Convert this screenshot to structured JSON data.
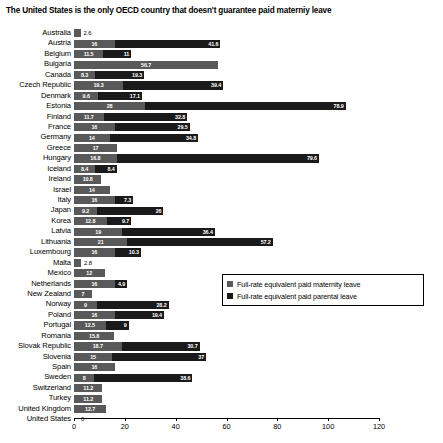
{
  "chart_data": {
    "type": "bar",
    "orientation": "horizontal",
    "stacked": true,
    "title": "The United States is the only OECD country that doesn't guarantee paid materniy leave",
    "xlabel": "",
    "ylabel": "",
    "xlim": [
      0,
      120
    ],
    "xticks": [
      0,
      20,
      40,
      60,
      80,
      100,
      120
    ],
    "xtick_labels": [
      "0",
      "20",
      "40",
      "60",
      "80",
      "100",
      "120"
    ],
    "grid": false,
    "legend_position": "middle-right",
    "series": [
      {
        "name": "Full-rate equivalent paid maternity leave",
        "color": "#595959",
        "values": [
          2.6,
          16,
          11.5,
          56.7,
          8.3,
          19.3,
          9.6,
          28,
          11.7,
          16,
          14,
          17,
          16.8,
          8.4,
          10.8,
          14,
          16,
          9.2,
          12.8,
          19,
          21,
          16,
          2.8,
          12,
          16,
          7,
          9,
          16,
          12.5,
          15.8,
          18.7,
          15,
          16,
          8,
          11.2,
          11.2,
          12.7,
          0
        ]
      },
      {
        "name": "Full-rate equivalent paid parental leave",
        "color": "#1a1a1a",
        "values": [
          0,
          41.6,
          11,
          0,
          19.3,
          39.4,
          17.1,
          78.9,
          32.8,
          29.5,
          34.8,
          0,
          79.6,
          8.4,
          0,
          0,
          7.3,
          26,
          9.7,
          36.4,
          57.2,
          10.3,
          0,
          0,
          4.9,
          0,
          28.2,
          19.4,
          9,
          0,
          30.7,
          37,
          0,
          38.6,
          0,
          0,
          0,
          0
        ]
      }
    ],
    "categories": [
      "Australia",
      "Austria",
      "Belgium",
      "Bulgaria",
      "Canada",
      "Czech Republic",
      "Denmark",
      "Estonia",
      "Finland",
      "France",
      "Germany",
      "Greece",
      "Hungary",
      "Iceland",
      "Ireland",
      "Israel",
      "Italy",
      "Japan",
      "Korea",
      "Latvia",
      "Lithuania",
      "Luxembourg",
      "Malta",
      "Mexico",
      "Netherlands",
      "New Zealand",
      "Norway",
      "Poland",
      "Portugal",
      "Romania",
      "Slovak Republic",
      "Slovenia",
      "Spain",
      "Sweden",
      "Switzerland",
      "Turkey",
      "United Kingdom",
      "United States"
    ],
    "rows": [
      {
        "label": "Australia",
        "mat": 2.6,
        "mat_text": "2.6",
        "mat_outside": true,
        "par": 0,
        "par_text": ""
      },
      {
        "label": "Austria",
        "mat": 16,
        "mat_text": "16",
        "mat_outside": false,
        "par": 41.6,
        "par_text": "41.6"
      },
      {
        "label": "Belgium",
        "mat": 11.5,
        "mat_text": "11.5",
        "mat_outside": false,
        "par": 11,
        "par_text": "11"
      },
      {
        "label": "Bulgaria",
        "mat": 56.7,
        "mat_text": "56.7",
        "mat_outside": false,
        "par": 0,
        "par_text": ""
      },
      {
        "label": "Canada",
        "mat": 8.3,
        "mat_text": "8.3",
        "mat_outside": false,
        "par": 19.3,
        "par_text": "19.3"
      },
      {
        "label": "Czech Republic",
        "mat": 19.3,
        "mat_text": "19.3",
        "mat_outside": false,
        "par": 39.4,
        "par_text": "39.4"
      },
      {
        "label": "Denmark",
        "mat": 9.6,
        "mat_text": "9.6",
        "mat_outside": false,
        "par": 17.1,
        "par_text": "17.1"
      },
      {
        "label": "Estonia",
        "mat": 28,
        "mat_text": "28",
        "mat_outside": false,
        "par": 78.9,
        "par_text": "78.9"
      },
      {
        "label": "Finland",
        "mat": 11.7,
        "mat_text": "11.7",
        "mat_outside": false,
        "par": 32.8,
        "par_text": "32.8"
      },
      {
        "label": "France",
        "mat": 16,
        "mat_text": "16",
        "mat_outside": false,
        "par": 29.5,
        "par_text": "29.5"
      },
      {
        "label": "Germany",
        "mat": 14,
        "mat_text": "14",
        "mat_outside": false,
        "par": 34.8,
        "par_text": "34.8"
      },
      {
        "label": "Greece",
        "mat": 17,
        "mat_text": "17",
        "mat_outside": false,
        "par": 0,
        "par_text": ""
      },
      {
        "label": "Hungary",
        "mat": 16.8,
        "mat_text": "16.8",
        "mat_outside": false,
        "par": 79.6,
        "par_text": "79.6"
      },
      {
        "label": "Iceland",
        "mat": 8.4,
        "mat_text": "8.4",
        "mat_outside": false,
        "par": 8.4,
        "par_text": "8.4"
      },
      {
        "label": "Ireland",
        "mat": 10.8,
        "mat_text": "10.8",
        "mat_outside": false,
        "par": 0,
        "par_text": ""
      },
      {
        "label": "Israel",
        "mat": 14,
        "mat_text": "14",
        "mat_outside": false,
        "par": 0,
        "par_text": ""
      },
      {
        "label": "Italy",
        "mat": 16,
        "mat_text": "16",
        "mat_outside": false,
        "par": 7.3,
        "par_text": "7.3"
      },
      {
        "label": "Japan",
        "mat": 9.2,
        "mat_text": "9.2",
        "mat_outside": false,
        "par": 26,
        "par_text": "26"
      },
      {
        "label": "Korea",
        "mat": 12.8,
        "mat_text": "12.8",
        "mat_outside": false,
        "par": 9.7,
        "par_text": "9.7"
      },
      {
        "label": "Latvia",
        "mat": 19,
        "mat_text": "19",
        "mat_outside": false,
        "par": 36.4,
        "par_text": "36.4"
      },
      {
        "label": "Lithuania",
        "mat": 21,
        "mat_text": "21",
        "mat_outside": false,
        "par": 57.2,
        "par_text": "57.2"
      },
      {
        "label": "Luxembourg",
        "mat": 16,
        "mat_text": "16",
        "mat_outside": false,
        "par": 10.3,
        "par_text": "10.3"
      },
      {
        "label": "Malta",
        "mat": 2.8,
        "mat_text": "2.8",
        "mat_outside": true,
        "par": 0,
        "par_text": ""
      },
      {
        "label": "Mexico",
        "mat": 12,
        "mat_text": "12",
        "mat_outside": false,
        "par": 0,
        "par_text": ""
      },
      {
        "label": "Netherlands",
        "mat": 16,
        "mat_text": "16",
        "mat_outside": false,
        "par": 4.9,
        "par_text": "4.9"
      },
      {
        "label": "New Zealand",
        "mat": 7,
        "mat_text": "7",
        "mat_outside": false,
        "par": 0,
        "par_text": ""
      },
      {
        "label": "Norway",
        "mat": 9,
        "mat_text": "9",
        "mat_outside": false,
        "par": 28.2,
        "par_text": "28.2"
      },
      {
        "label": "Poland",
        "mat": 16,
        "mat_text": "16",
        "mat_outside": false,
        "par": 19.4,
        "par_text": "19.4"
      },
      {
        "label": "Portugal",
        "mat": 12.5,
        "mat_text": "12.5",
        "mat_outside": false,
        "par": 9,
        "par_text": "9"
      },
      {
        "label": "Romania",
        "mat": 15.8,
        "mat_text": "15.8",
        "mat_outside": false,
        "par": 0,
        "par_text": ""
      },
      {
        "label": "Slovak Republic",
        "mat": 18.7,
        "mat_text": "18.7",
        "mat_outside": false,
        "par": 30.7,
        "par_text": "30.7"
      },
      {
        "label": "Slovenia",
        "mat": 15,
        "mat_text": "15",
        "mat_outside": false,
        "par": 37,
        "par_text": "37"
      },
      {
        "label": "Spain",
        "mat": 16,
        "mat_text": "16",
        "mat_outside": false,
        "par": 0,
        "par_text": ""
      },
      {
        "label": "Sweden",
        "mat": 8,
        "mat_text": "8",
        "mat_outside": false,
        "par": 38.6,
        "par_text": "38.6"
      },
      {
        "label": "Switzerland",
        "mat": 11.2,
        "mat_text": "11.2",
        "mat_outside": false,
        "par": 0,
        "par_text": ""
      },
      {
        "label": "Turkey",
        "mat": 11.2,
        "mat_text": "11.2",
        "mat_outside": false,
        "par": 0,
        "par_text": ""
      },
      {
        "label": "United Kingdom",
        "mat": 12.7,
        "mat_text": "12.7",
        "mat_outside": false,
        "par": 0,
        "par_text": ""
      },
      {
        "label": "United States",
        "mat": 0,
        "mat_text": "0",
        "mat_outside": true,
        "par": 0,
        "par_text": ""
      }
    ]
  },
  "legend": {
    "items": [
      {
        "label": "Full-rate equivalent paid maternity leave",
        "color": "#595959",
        "swatch": "mat"
      },
      {
        "label": "Full-rate equivalent paid parental leave",
        "color": "#1a1a1a",
        "swatch": "par"
      }
    ]
  }
}
